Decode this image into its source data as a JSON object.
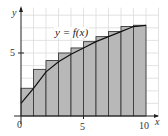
{
  "chart_data": {
    "type": "bar",
    "subtype": "riemann-sum-right-endpoints",
    "title": "",
    "xlabel": "x",
    "ylabel": "y",
    "function_label": "y = f(x)",
    "xlim": [
      0,
      10
    ],
    "ylim": [
      0,
      8
    ],
    "grid": true,
    "x_ticks": [
      0,
      5,
      10
    ],
    "y_ticks": [
      5
    ],
    "categories": [
      "0-1",
      "1-2",
      "2-3",
      "3-4",
      "4-5",
      "5-6",
      "6-7",
      "7-8",
      "8-9",
      "9-10"
    ],
    "values": [
      2.2,
      3.7,
      4.4,
      5.0,
      5.4,
      5.9,
      6.3,
      6.7,
      7.1,
      7.2
    ],
    "curve": {
      "x": [
        0,
        1,
        2,
        3,
        4,
        5,
        6,
        7,
        8,
        9,
        10
      ],
      "y": [
        1.0,
        2.2,
        3.5,
        4.3,
        4.9,
        5.4,
        5.9,
        6.3,
        6.7,
        7.1,
        7.2
      ]
    },
    "colors": {
      "bar_fill": "#b8b8b8",
      "bar_stroke": "#3a3a3a",
      "grid": "#dcdcdc",
      "curve": "#111111"
    }
  },
  "labels": {
    "y_axis": "y",
    "x_axis": "x",
    "origin": "0",
    "x_tick_5": "5",
    "x_tick_10": "10",
    "y_tick_5": "5",
    "function": "y = f(x)"
  }
}
